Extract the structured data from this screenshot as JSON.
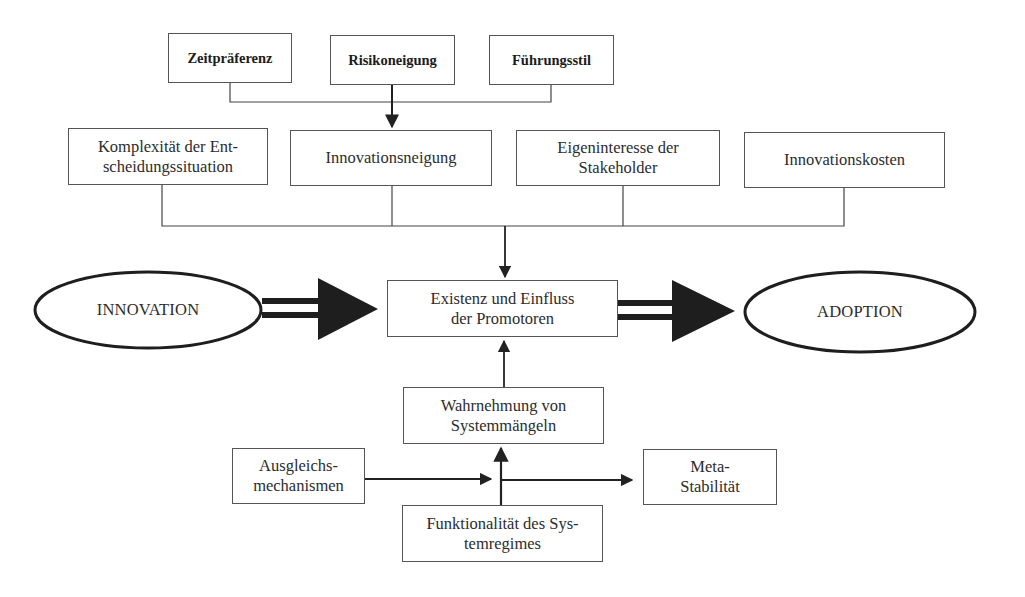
{
  "diagram": {
    "top_factors": [
      {
        "id": "zeitpraeferenz",
        "label": "Zeitpräferenz"
      },
      {
        "id": "risikoneigung",
        "label": "Risikoneigung"
      },
      {
        "id": "fuehrungsstil",
        "label": "Führungsstil"
      }
    ],
    "influence_factors": [
      {
        "id": "komplexitaet",
        "label": "Komplexität der Ent-\nscheidungssituation"
      },
      {
        "id": "innovationsneigung",
        "label": "Innovationsneigung"
      },
      {
        "id": "eigeninteresse",
        "label": "Eigeninteresse der\nStakeholder"
      },
      {
        "id": "innovationskosten",
        "label": "Innovationskosten"
      }
    ],
    "center": {
      "id": "promotoren",
      "label": "Existenz und Einfluss\nder Promotoren"
    },
    "start": {
      "id": "innovation",
      "label": "INNOVATION"
    },
    "end": {
      "id": "adoption",
      "label": "ADOPTION"
    },
    "lower": {
      "wahrnehmung": {
        "label": "Wahrnehmung von\nSystemmängeln"
      },
      "ausgleich": {
        "label": "Ausgleichs-\nmechanismen"
      },
      "funktionalitaet": {
        "label": "Funktionalität des Sys-\ntemregimes"
      },
      "metastabilitaet": {
        "label": "Meta-\nStabilität"
      }
    },
    "edges": [
      {
        "from": "zeitpraeferenz",
        "to": "innovationsneigung"
      },
      {
        "from": "risikoneigung",
        "to": "innovationsneigung"
      },
      {
        "from": "fuehrungsstil",
        "to": "innovationsneigung"
      },
      {
        "from": "komplexitaet",
        "to": "promotoren"
      },
      {
        "from": "innovationsneigung",
        "to": "promotoren"
      },
      {
        "from": "eigeninteresse",
        "to": "promotoren"
      },
      {
        "from": "innovationskosten",
        "to": "promotoren"
      },
      {
        "from": "innovation",
        "to": "promotoren",
        "style": "thick-double"
      },
      {
        "from": "promotoren",
        "to": "adoption",
        "style": "thick-double"
      },
      {
        "from": "wahrnehmung",
        "to": "promotoren"
      },
      {
        "from": "funktionalitaet",
        "to": "wahrnehmung"
      },
      {
        "from": "ausgleich",
        "to": "metastabilitaet"
      }
    ],
    "colors": {
      "line": "#3a3a3a",
      "arrow_fill": "#1e1e1e",
      "box_border": "#555555",
      "background": "#ffffff"
    }
  }
}
